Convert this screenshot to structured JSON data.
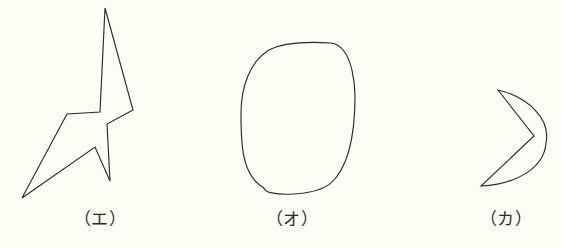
{
  "page": {
    "background_color": "#fdfdf6",
    "ink_color": "#2b2b28",
    "width": 561,
    "height": 248
  },
  "figures": [
    {
      "id": "figure-e",
      "label": "（エ）",
      "shape_name": "irregular-star-polygon",
      "shape_type": "polygon",
      "stroke_color": "#2b2b28",
      "fill": "none",
      "points": [
        [
          105,
          8
        ],
        [
          133,
          110
        ],
        [
          107,
          124
        ],
        [
          110,
          181
        ],
        [
          95,
          147
        ],
        [
          22,
          198
        ],
        [
          67,
          114
        ],
        [
          100,
          112
        ]
      ]
    },
    {
      "id": "figure-o",
      "label": "（オ）",
      "shape_name": "closed-oval-egg",
      "shape_type": "closed-curve",
      "stroke_color": "#2b2b28",
      "fill": "none",
      "bounds": {
        "left": 241,
        "top": 43,
        "right": 356,
        "bottom": 197
      },
      "center": [
        298,
        120
      ],
      "radius_x": 57,
      "radius_y": 77
    },
    {
      "id": "figure-ka",
      "label": "（カ）",
      "shape_name": "crescent-arrowhead",
      "shape_type": "closed-mixed",
      "stroke_color": "#2b2b28",
      "fill": "none",
      "points": [
        [
          498,
          90
        ],
        [
          534,
          136
        ],
        [
          481,
          186
        ]
      ],
      "arc_peak": [
        546,
        143
      ]
    }
  ],
  "labels": {
    "e": "（エ）",
    "o": "（オ）",
    "ka": "（カ）"
  }
}
